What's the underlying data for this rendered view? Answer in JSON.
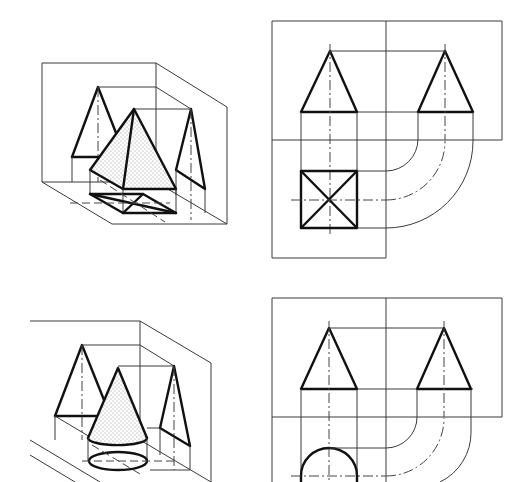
{
  "figure": {
    "type": "technical-drawing",
    "colors": {
      "line": "#111111",
      "thin_line": "#3a3a3a",
      "background": "#ffffff",
      "shading": "#888888"
    }
  },
  "panels": [
    {
      "id": "pyramid-isometric",
      "shape": "pyramid",
      "view": "isometric-projection-box",
      "position": "top-left"
    },
    {
      "id": "pyramid-orthographic",
      "shape": "pyramid",
      "view": "three-view-orthographic",
      "position": "top-right",
      "views": [
        "front-triangle",
        "side-triangle",
        "top-square-with-diagonals"
      ]
    },
    {
      "id": "cone-isometric",
      "shape": "cone",
      "view": "isometric-projection-box",
      "position": "bottom-left"
    },
    {
      "id": "cone-orthographic",
      "shape": "cone",
      "view": "three-view-orthographic",
      "position": "bottom-right",
      "views": [
        "front-triangle",
        "side-triangle",
        "top-circle"
      ]
    }
  ]
}
